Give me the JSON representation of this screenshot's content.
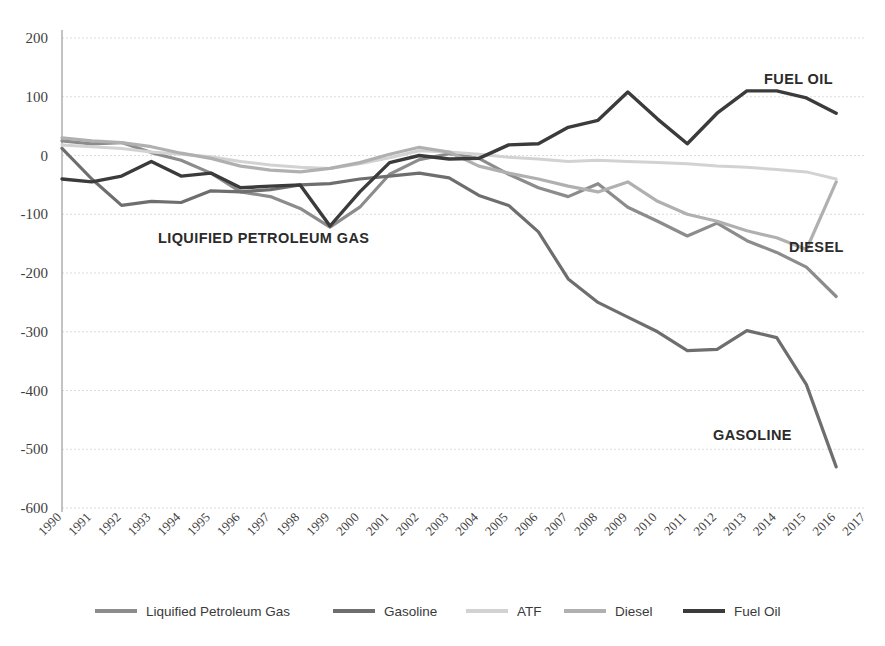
{
  "chart_data": {
    "type": "line",
    "title": "",
    "subtitle": "",
    "xlabel": "",
    "ylabel": "",
    "grid": true,
    "legend_position": "bottom",
    "xlim": [
      1990,
      2017
    ],
    "ylim": [
      -600,
      200
    ],
    "yticks": [
      200,
      100,
      0,
      -100,
      -200,
      -300,
      -400,
      -500,
      -600
    ],
    "ytick_labels": [
      "200",
      "100",
      "0",
      "-100",
      "-200",
      "-300",
      "-400",
      "-500",
      "-600"
    ],
    "categories": [
      "1990",
      "1991",
      "1992",
      "1993",
      "1994",
      "1995",
      "1996",
      "1997",
      "1998",
      "1999",
      "2000",
      "2001",
      "2002",
      "2003",
      "2004",
      "2005",
      "2006",
      "2007",
      "2008",
      "2009",
      "2010",
      "2011",
      "2012",
      "2013",
      "2014",
      "2015",
      "2016",
      "2017"
    ],
    "x": [
      1990,
      1991,
      1992,
      1993,
      1994,
      1995,
      1996,
      1997,
      1998,
      1999,
      2000,
      2001,
      2002,
      2003,
      2004,
      2005,
      2006,
      2007,
      2008,
      2009,
      2010,
      2011,
      2012,
      2013,
      2014,
      2015,
      2016,
      2017
    ],
    "series": [
      {
        "name": "Liquified Petroleum Gas",
        "color": "#8c8c8c",
        "width": 3.2,
        "values": [
          25,
          20,
          22,
          5,
          -8,
          -30,
          -62,
          -70,
          -90,
          -122,
          -88,
          -32,
          -7,
          3,
          -5,
          -32,
          -55,
          -70,
          -48,
          -88,
          -112,
          -137,
          -115,
          -145,
          -165,
          -190,
          -240,
          null
        ]
      },
      {
        "name": "Gasoline",
        "color": "#6e6e6e",
        "width": 3.2,
        "values": [
          12,
          -40,
          -85,
          -78,
          -80,
          -60,
          -62,
          -58,
          -50,
          -48,
          -40,
          -35,
          -30,
          -38,
          -68,
          -85,
          -130,
          -210,
          -250,
          -275,
          -300,
          -332,
          -330,
          -298,
          -310,
          -390,
          -530,
          null
        ]
      },
      {
        "name": "ATF",
        "color": "#d2d2d2",
        "width": 3.0,
        "values": [
          18,
          15,
          12,
          6,
          2,
          -2,
          -10,
          -16,
          -20,
          -22,
          -14,
          -4,
          8,
          6,
          2,
          -3,
          -6,
          -10,
          -8,
          -10,
          -12,
          -14,
          -18,
          -20,
          -24,
          -28,
          -40,
          null
        ]
      },
      {
        "name": "Diesel",
        "color": "#b0b0b0",
        "width": 3.2,
        "values": [
          30,
          25,
          22,
          15,
          4,
          -5,
          -18,
          -25,
          -28,
          -22,
          -12,
          2,
          14,
          6,
          -18,
          -30,
          -40,
          -52,
          -62,
          -45,
          -78,
          -100,
          -112,
          -128,
          -140,
          -160,
          -45,
          null
        ]
      },
      {
        "name": "Fuel Oil",
        "color": "#3b3b3b",
        "width": 3.4,
        "values": [
          -40,
          -45,
          -35,
          -10,
          -35,
          -30,
          -55,
          -52,
          -50,
          -120,
          -62,
          -12,
          0,
          -6,
          -5,
          18,
          20,
          48,
          60,
          108,
          62,
          20,
          72,
          110,
          110,
          98,
          72,
          null
        ]
      }
    ],
    "annotations": [
      {
        "text": "LIQUIFIED PETROLEUM GAS",
        "x": 158,
        "y": 243
      },
      {
        "text": "FUEL OIL",
        "x": 764,
        "y": 84
      },
      {
        "text": "DIESEL",
        "x": 789,
        "y": 252
      },
      {
        "text": "GASOLINE",
        "x": 713,
        "y": 440
      }
    ]
  },
  "legend": {
    "items": [
      {
        "label": "Liquified Petroleum Gas",
        "color": "#8c8c8c"
      },
      {
        "label": "Gasoline",
        "color": "#6e6e6e"
      },
      {
        "label": "ATF",
        "color": "#d2d2d2"
      },
      {
        "label": "Diesel",
        "color": "#b0b0b0"
      },
      {
        "label": "Fuel Oil",
        "color": "#3b3b3b"
      }
    ]
  },
  "colors": {
    "background": "#ffffff",
    "gridline": "#dcdcdc",
    "axis": "#9a9a9a",
    "text": "#3a3a3a"
  }
}
